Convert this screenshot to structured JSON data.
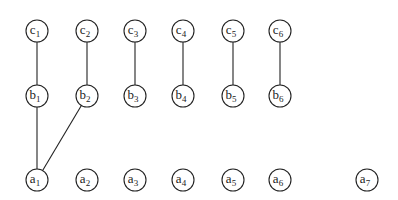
{
  "diagram": {
    "type": "graph",
    "node_radius": 11,
    "nodes": [
      {
        "id": "c1",
        "letter": "c",
        "sub": "1",
        "x": 37,
        "y": 31
      },
      {
        "id": "c2",
        "letter": "c",
        "sub": "2",
        "x": 87,
        "y": 31
      },
      {
        "id": "c3",
        "letter": "c",
        "sub": "3",
        "x": 135,
        "y": 31
      },
      {
        "id": "c4",
        "letter": "c",
        "sub": "4",
        "x": 183,
        "y": 31
      },
      {
        "id": "c5",
        "letter": "c",
        "sub": "5",
        "x": 233,
        "y": 31
      },
      {
        "id": "c6",
        "letter": "c",
        "sub": "6",
        "x": 280,
        "y": 31
      },
      {
        "id": "b1",
        "letter": "b",
        "sub": "1",
        "x": 37,
        "y": 96
      },
      {
        "id": "b2",
        "letter": "b",
        "sub": "2",
        "x": 87,
        "y": 96
      },
      {
        "id": "b3",
        "letter": "b",
        "sub": "3",
        "x": 135,
        "y": 96
      },
      {
        "id": "b4",
        "letter": "b",
        "sub": "4",
        "x": 183,
        "y": 96
      },
      {
        "id": "b5",
        "letter": "b",
        "sub": "5",
        "x": 233,
        "y": 96
      },
      {
        "id": "b6",
        "letter": "b",
        "sub": "6",
        "x": 280,
        "y": 96
      },
      {
        "id": "a1",
        "letter": "a",
        "sub": "1",
        "x": 37,
        "y": 180
      },
      {
        "id": "a2",
        "letter": "a",
        "sub": "2",
        "x": 87,
        "y": 180
      },
      {
        "id": "a3",
        "letter": "a",
        "sub": "3",
        "x": 135,
        "y": 180
      },
      {
        "id": "a4",
        "letter": "a",
        "sub": "4",
        "x": 183,
        "y": 180
      },
      {
        "id": "a5",
        "letter": "a",
        "sub": "5",
        "x": 233,
        "y": 180
      },
      {
        "id": "a6",
        "letter": "a",
        "sub": "6",
        "x": 280,
        "y": 180
      },
      {
        "id": "a7",
        "letter": "a",
        "sub": "7",
        "x": 367,
        "y": 180
      }
    ],
    "edges": [
      [
        "c1",
        "b1"
      ],
      [
        "c2",
        "b2"
      ],
      [
        "c3",
        "b3"
      ],
      [
        "c4",
        "b4"
      ],
      [
        "c5",
        "b5"
      ],
      [
        "c6",
        "b6"
      ],
      [
        "b1",
        "a1"
      ],
      [
        "b2",
        "a1"
      ]
    ],
    "colors": {
      "stroke": "#222222",
      "fill": "#ffffff",
      "background": "#ffffff"
    }
  }
}
